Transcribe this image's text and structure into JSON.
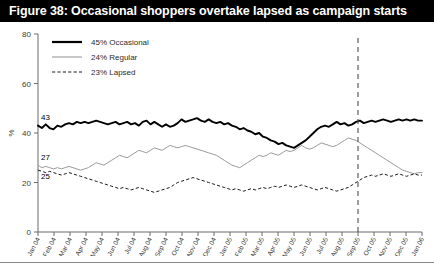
{
  "figure": {
    "title": "Figure 38: Occasional shoppers overtake lapsed as campaign starts",
    "title_bg": "#000000",
    "title_fg": "#ffffff"
  },
  "legend": {
    "position": "top-left",
    "items": [
      {
        "label": "45% Occasional",
        "style": "solid-thick",
        "color": "#000000"
      },
      {
        "label": "24% Regular",
        "style": "solid-thin",
        "color": "#9a9a9a"
      },
      {
        "label": "23% Lapsed",
        "style": "dashed",
        "color": "#1a1a1a"
      }
    ]
  },
  "annotations": {
    "start_labels": [
      {
        "text": "43",
        "series": "45% Occasional"
      },
      {
        "text": "27",
        "series": "24% Regular"
      },
      {
        "text": "25",
        "series": "23% Lapsed"
      }
    ],
    "event_line": {
      "at": "Sep 05",
      "style": "dashed",
      "color": "#4d4d4d"
    }
  },
  "chart_data": {
    "type": "line",
    "title": "Figure 38: Occasional shoppers overtake lapsed as campaign starts",
    "xlabel": "",
    "ylabel": "%",
    "ylim": [
      0,
      80
    ],
    "yticks": [
      0,
      20,
      40,
      60,
      80
    ],
    "grid": false,
    "legend_position": "top-left",
    "x_tick_labels": [
      "Jan 04",
      "Feb 04",
      "Mar 04",
      "Apr 04",
      "May 04",
      "Jun 04",
      "Jul 04",
      "Aug 04",
      "Sep 04",
      "Oct 04",
      "Nov 04",
      "Dec 04",
      "Jan 05",
      "Feb 05",
      "Mar 05",
      "Apr 05",
      "May 05",
      "Jun 05",
      "Jul 05",
      "Aug 05",
      "Sep 05",
      "Oct 05",
      "Nov 05",
      "Dec 05",
      "Jan 06"
    ],
    "x_points_per_month": 4,
    "series": [
      {
        "name": "45% Occasional",
        "color": "#000000",
        "style": "solid-thick",
        "start_value": 43,
        "end_value": 45,
        "values": [
          43,
          42,
          43.5,
          42,
          41.5,
          43,
          42.5,
          43.5,
          44,
          43.5,
          44.5,
          44,
          44.5,
          44,
          44.5,
          45,
          44.5,
          44,
          43.5,
          44,
          44.5,
          43.5,
          44,
          44.5,
          43.5,
          44,
          43,
          44.5,
          45,
          43.5,
          44.5,
          43.5,
          42.5,
          43.5,
          42.5,
          43,
          44,
          45.5,
          44.5,
          45,
          45.5,
          46,
          45,
          44.5,
          45.5,
          44.5,
          44,
          44.5,
          43.5,
          44,
          43,
          42.5,
          41.5,
          42,
          41,
          40.5,
          39.5,
          40,
          38.5,
          38,
          37,
          36.5,
          35.5,
          36,
          35,
          34.5,
          34,
          35,
          36,
          37,
          38.5,
          40,
          41.5,
          42.5,
          43,
          42.5,
          43.5,
          44.5,
          43.5,
          44,
          43,
          43.5,
          44.5,
          45,
          44,
          44.5,
          45,
          44.5,
          45,
          45.5,
          45,
          44.5,
          45,
          45.5,
          45,
          45.5,
          45,
          45.5,
          45,
          45
        ]
      },
      {
        "name": "24% Regular",
        "color": "#9a9a9a",
        "style": "solid-thin",
        "start_value": 27,
        "end_value": 24,
        "values": [
          27,
          26,
          26.5,
          26,
          25.5,
          26,
          25.5,
          26,
          26.5,
          26,
          25.5,
          25,
          25.5,
          26,
          27,
          28,
          27.5,
          27,
          28,
          29,
          30,
          31,
          30.5,
          30,
          31,
          32,
          33,
          32.5,
          32,
          33,
          34,
          33.5,
          33,
          34,
          35,
          34.5,
          34,
          34.5,
          35,
          34.5,
          34,
          33.5,
          33,
          32.5,
          32,
          31.5,
          31,
          30,
          29,
          28,
          27,
          26.5,
          26,
          27,
          28,
          29,
          30,
          31,
          30.5,
          31,
          32,
          31.5,
          31,
          32,
          33,
          32.5,
          33,
          34,
          35,
          34,
          33.5,
          34,
          35,
          36,
          35.5,
          35,
          34.5,
          35,
          36,
          37,
          38,
          37.5,
          37,
          36,
          35,
          34,
          33,
          32,
          31,
          30,
          29,
          28,
          27,
          26,
          25,
          24.5,
          24,
          23.5,
          24,
          24
        ]
      },
      {
        "name": "23% Lapsed",
        "color": "#1a1a1a",
        "style": "dashed",
        "start_value": 25,
        "end_value": 23,
        "values": [
          25,
          24.5,
          24,
          24.5,
          24,
          23.5,
          23,
          23.5,
          24,
          23.5,
          23,
          22.5,
          22,
          21.5,
          21,
          20.5,
          20,
          19.5,
          19,
          18.5,
          18,
          17.5,
          18,
          17.5,
          17,
          17.5,
          18,
          17.5,
          17,
          16.5,
          16,
          16.5,
          17,
          17.5,
          18,
          19,
          20,
          20.5,
          21,
          21.5,
          22,
          21.5,
          21,
          20.5,
          20,
          19.5,
          19,
          18.5,
          18,
          17.5,
          17,
          17.5,
          17,
          16.5,
          17,
          17.5,
          17,
          17.5,
          18,
          17.5,
          18,
          18.5,
          18,
          18.5,
          19,
          18.5,
          18,
          18.5,
          19,
          18.5,
          18,
          17.5,
          17,
          17.5,
          18,
          17.5,
          17,
          16.5,
          17,
          17.5,
          18,
          19,
          20,
          21,
          22,
          22.5,
          23,
          22.5,
          23,
          23.5,
          23,
          22.5,
          23,
          23.5,
          23,
          22.5,
          23,
          23.5,
          23,
          23
        ]
      }
    ]
  }
}
